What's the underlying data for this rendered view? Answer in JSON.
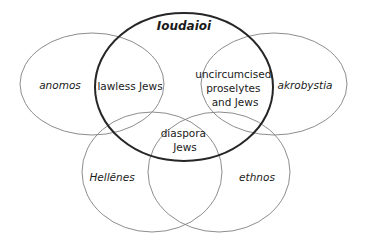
{
  "diagram": {
    "type": "venn",
    "title_label": "Ioudaioi",
    "background_color": "#ffffff",
    "line_color": "#808080",
    "emphasis_line_color": "#262626",
    "text_color": "#1a1a1a",
    "sets": [
      {
        "id": "anomos",
        "label": "anomos",
        "style": "italic",
        "emphasis": false,
        "shape": "ellipse",
        "cx": 92,
        "cy": 84,
        "rx": 72,
        "ry": 51,
        "label_x": 60,
        "label_y": 86
      },
      {
        "id": "ioudaioi",
        "label": "Ioudaioi",
        "style": "bold-italic",
        "emphasis": true,
        "shape": "ellipse",
        "cx": 184,
        "cy": 87,
        "rx": 89,
        "ry": 74,
        "label_x": 184,
        "label_y": 26
      },
      {
        "id": "akrobystia",
        "label": "akrobystia",
        "style": "italic",
        "emphasis": false,
        "shape": "ellipse",
        "cx": 274,
        "cy": 84,
        "rx": 73,
        "ry": 51,
        "label_x": 305,
        "label_y": 86
      },
      {
        "id": "hellenes",
        "label": "Hellēnes",
        "style": "italic",
        "emphasis": false,
        "shape": "ellipse",
        "cx": 152,
        "cy": 172,
        "rx": 70,
        "ry": 60,
        "label_x": 112,
        "label_y": 178
      },
      {
        "id": "ethnos",
        "label": "ethnos",
        "style": "italic",
        "emphasis": false,
        "shape": "ellipse",
        "cx": 219,
        "cy": 172,
        "rx": 71,
        "ry": 60,
        "label_x": 257,
        "label_y": 178
      }
    ],
    "intersections": [
      {
        "id": "lawless-jews",
        "lines": [
          "lawless Jews"
        ],
        "style": "plain",
        "label_x": 130,
        "label_y": 87
      },
      {
        "id": "uncircumcised-proselytes-and-jews",
        "lines": [
          "uncircumcised",
          "proselytes",
          "and Jews"
        ],
        "style": "plain",
        "label_x": 235,
        "label_y": 75
      },
      {
        "id": "diaspora-jews",
        "lines": [
          "diaspora",
          "Jews"
        ],
        "style": "plain",
        "label_x": 185,
        "label_y": 134
      }
    ]
  }
}
